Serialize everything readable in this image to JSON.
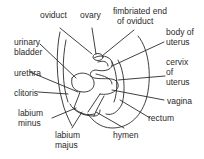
{
  "diagram": {
    "labels": {
      "oviduct": "oviduct",
      "ovary": "ovary",
      "fimbriated_1": "fimbriated end",
      "fimbriated_2": "of oviduct",
      "urinary_1": "urinary",
      "urinary_2": "bladder",
      "body_1": "body of",
      "body_2": "uterus",
      "urethra": "urethra",
      "cervix_1": "cervix",
      "cervix_2": "of",
      "cervix_3": "uterus",
      "clitoris": "clitoris",
      "vagina": "vagina",
      "labium_minus_1": "labium",
      "labium_minus_2": "minus",
      "rectum": "rectum",
      "labium_majus_1": "labium",
      "labium_majus_2": "majus",
      "hymen": "hymen"
    },
    "colors": {
      "line": "#2a2a2a",
      "background": "#ffffff"
    }
  }
}
